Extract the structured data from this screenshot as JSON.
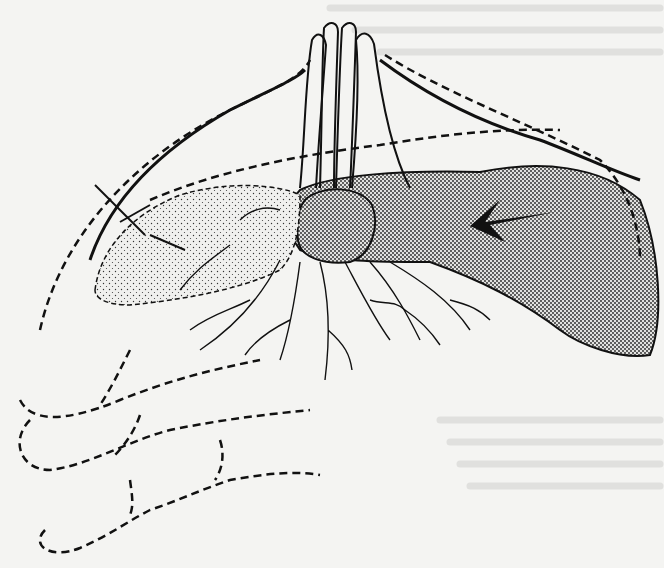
{
  "image": {
    "kind": "scanned anatomical line illustration",
    "subject": "hand with fingers, dashed finger outlines, stippled thumb region and branching nerve fibres",
    "width": 664,
    "height": 568,
    "colors": {
      "paper": "#f4f4f2",
      "ink": "#111111",
      "stipple": "#222222",
      "bleed_text": "#d6d6d4"
    }
  },
  "elements": {
    "raised_fingers": {
      "count": 4,
      "position": "top-center"
    },
    "thumb_pad": {
      "shading": "dense dot screen",
      "marker": "arrow pointing left"
    },
    "palm_region": {
      "shading": "light stipple",
      "marker": "cross hatch mark"
    },
    "nerve_branches": {
      "position": "lower-center"
    },
    "dashed_finger_outlines": {
      "count": 3,
      "position": "lower-left"
    }
  }
}
